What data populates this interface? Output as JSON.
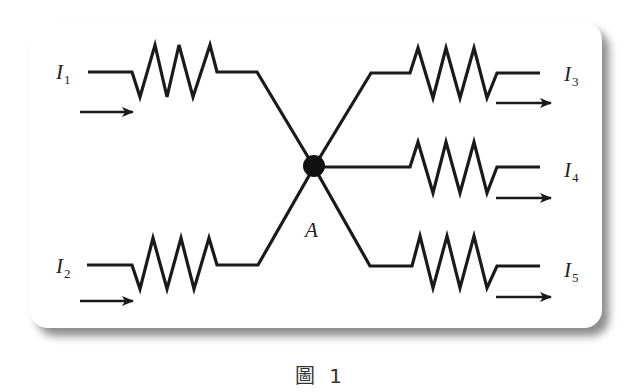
{
  "figure": {
    "caption": "圖 1",
    "node_label": "A",
    "currents": [
      {
        "id": "I1",
        "symbol": "I",
        "subscript": "1",
        "direction": "in",
        "side": "left-top"
      },
      {
        "id": "I2",
        "symbol": "I",
        "subscript": "2",
        "direction": "in",
        "side": "left-bottom"
      },
      {
        "id": "I3",
        "symbol": "I",
        "subscript": "3",
        "direction": "out",
        "side": "right-top"
      },
      {
        "id": "I4",
        "symbol": "I",
        "subscript": "4",
        "direction": "out",
        "side": "right-middle"
      },
      {
        "id": "I5",
        "symbol": "I",
        "subscript": "5",
        "direction": "out",
        "side": "right-bottom"
      }
    ],
    "resistor_count": 5,
    "colors": {
      "wire": "#1a1a1a",
      "background": "#ffffff",
      "shadow": "#777777"
    }
  }
}
